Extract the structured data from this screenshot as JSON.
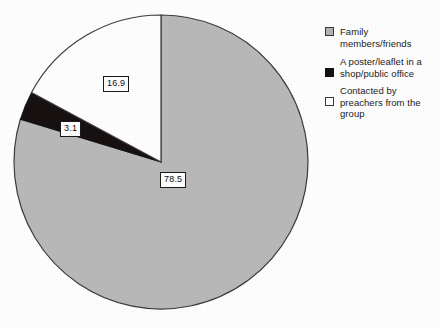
{
  "chart_data": {
    "type": "pie",
    "title": "",
    "subtitle": "",
    "labels": [
      "Family members/friends",
      "A poster/leaflet in a shop/public office",
      "Contacted by preachers from the group"
    ],
    "values": [
      78.5,
      3.1,
      16.9
    ],
    "value_labels": [
      "78.5",
      "3.1",
      "16.9"
    ],
    "colors": [
      "#b9b9b9",
      "#171111",
      "#ffffff"
    ],
    "legend_position": "right",
    "grid": false,
    "start_angle_deg": 0,
    "direction": "clockwise",
    "slice_border_color": "#3a3a3a"
  },
  "legend": {
    "items": [
      {
        "label": "Family members/friends",
        "swatch": "gray-swatch"
      },
      {
        "label": "A poster/leaflet in a shop/public office",
        "swatch": "black-swatch"
      },
      {
        "label": "Contacted by preachers from the group",
        "swatch": "white-swatch"
      }
    ]
  },
  "labels": {
    "gray_value": "78.5",
    "black_value": "3.1",
    "white_value": "16.9"
  }
}
